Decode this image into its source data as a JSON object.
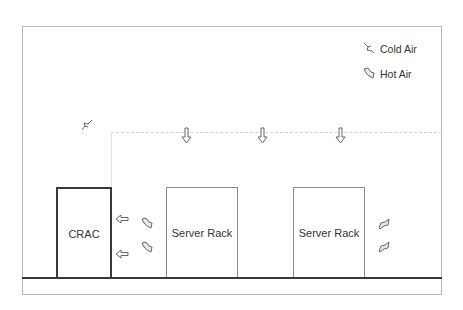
{
  "diagram": {
    "components": {
      "crac": {
        "label": "CRAC"
      },
      "racks": [
        {
          "label": "Server Rack"
        },
        {
          "label": "Server Rack"
        }
      ]
    },
    "legend": [
      {
        "icon": "cold-air-arrow-icon",
        "label": "Cold Air"
      },
      {
        "icon": "hot-air-arrow-icon",
        "label": "Hot Air"
      }
    ],
    "colors": {
      "frame": "#b8b8b8",
      "floor": "#3a3a3a",
      "crac_border": "#3a3a3a",
      "rack_border": "#8a8a8a",
      "plenum_line": "#d0d0d0",
      "arrow_stroke": "#666666",
      "arrow_fill": "#e8e8e8"
    },
    "airflow": {
      "ceiling_plenum": "dashed",
      "down_arrows": 3,
      "return_arrows_to_crac": 2,
      "hot_air_icons_left": 2,
      "hot_air_icons_right": 2
    }
  }
}
